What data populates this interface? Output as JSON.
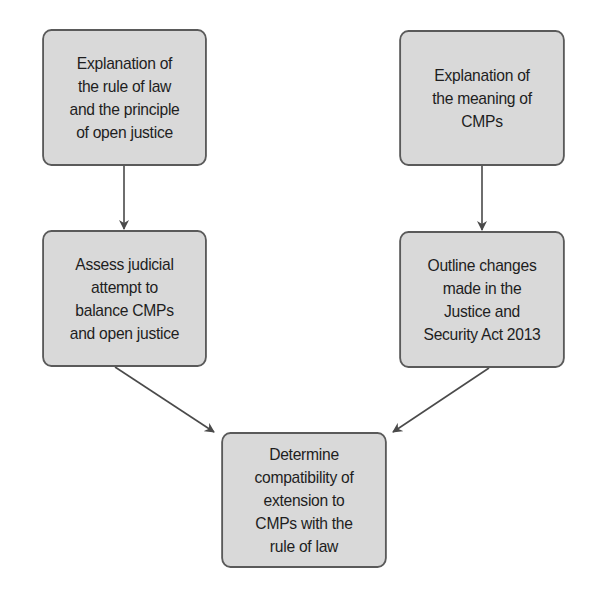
{
  "diagram": {
    "type": "flowchart",
    "colors": {
      "node_fill": "#d9d9d9",
      "node_border": "#5a5a5a",
      "arrow": "#4a4a4a",
      "text": "#1e1e1e",
      "background": "#ffffff"
    },
    "nodes": [
      {
        "id": "n1",
        "label": "Explanation of\nthe rule of law\nand the principle\nof open justice"
      },
      {
        "id": "n2",
        "label": "Explanation of\nthe meaning of\nCMPs"
      },
      {
        "id": "n3",
        "label": "Assess judicial\nattempt to\nbalance CMPs\nand open justice"
      },
      {
        "id": "n4",
        "label": "Outline changes\nmade in the\nJustice and\nSecurity Act 2013"
      },
      {
        "id": "n5",
        "label": "Determine\ncompatibility of\nextension to\nCMPs with the\nrule of law"
      }
    ],
    "edges": [
      {
        "from": "n1",
        "to": "n3"
      },
      {
        "from": "n2",
        "to": "n4"
      },
      {
        "from": "n3",
        "to": "n5"
      },
      {
        "from": "n4",
        "to": "n5"
      }
    ]
  }
}
